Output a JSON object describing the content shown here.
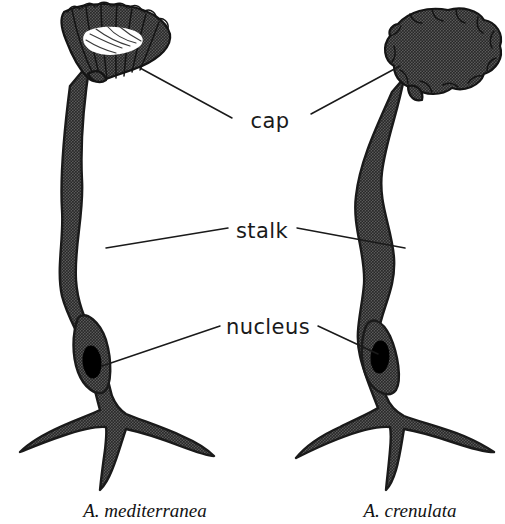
{
  "figure": {
    "background_color": "#ffffff",
    "ink_color": "#1a1a1a",
    "body_fill_color": "#4a4a4a",
    "nucleus_color": "#000000"
  },
  "labels": {
    "cap": "cap",
    "stalk": "stalk",
    "nucleus": "nucleus"
  },
  "species": {
    "left": "A. mediterranea",
    "right": "A. crenulata"
  },
  "annotations": [
    {
      "label": "cap",
      "x": 270,
      "y": 120,
      "points_to": [
        "left-cap",
        "right-cap"
      ]
    },
    {
      "label": "stalk",
      "x": 262,
      "y": 232,
      "points_to": [
        "left-stalk",
        "right-stalk"
      ]
    },
    {
      "label": "nucleus",
      "x": 258,
      "y": 330,
      "points_to": [
        "left-nucleus",
        "right-nucleus"
      ]
    }
  ],
  "organisms": [
    {
      "name": "A. mediterranea",
      "cap_type": "funnel-shaped rayed cup with white center",
      "parts": [
        "cap",
        "stalk",
        "nucleus",
        "rhizoid"
      ]
    },
    {
      "name": "A. crenulata",
      "cap_type": "rounded scalloped disc",
      "parts": [
        "cap",
        "stalk",
        "nucleus",
        "rhizoid"
      ]
    }
  ]
}
